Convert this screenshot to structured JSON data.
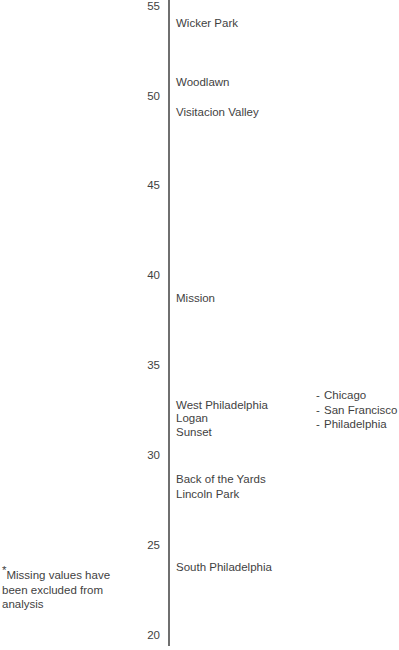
{
  "chart_data": {
    "type": "scatter",
    "orientation": "vertical-number-line",
    "title": "",
    "subtitle": "",
    "xlabel": "",
    "ylabel": "",
    "ylim": [
      20,
      55
    ],
    "y_ticks": [
      55,
      50,
      45,
      40,
      35,
      30,
      25,
      20
    ],
    "y_tick_labels": [
      "55",
      "50",
      "45",
      "40",
      "35",
      "30",
      "25",
      "20"
    ],
    "grid": false,
    "legend_position": "right",
    "series": [
      {
        "name": "Chicago",
        "points": [
          {
            "label": "Wicker Park",
            "value": 54.1
          },
          {
            "label": "Woodlawn",
            "value": 51.1
          },
          {
            "label": "Logan",
            "value": 32.2
          },
          {
            "label": "Back of the Yards",
            "value": 29.7
          },
          {
            "label": "Lincoln Park",
            "value": 28.9
          }
        ]
      },
      {
        "name": "San Francisco",
        "points": [
          {
            "label": "Visitacion Valley",
            "value": 49.4
          },
          {
            "label": "Mission",
            "value": 38.8
          },
          {
            "label": "Sunset",
            "value": 31.4
          }
        ]
      },
      {
        "name": "Philadelphia",
        "points": [
          {
            "label": "West Philadelphia",
            "value": 32.9
          },
          {
            "label": "South Philadelphia",
            "value": 24.8
          }
        ]
      }
    ],
    "point_labels": [
      {
        "label": "Wicker Park",
        "value": 54.1,
        "top": 17
      },
      {
        "label": "Woodlawn",
        "value": 51.1,
        "top": 76
      },
      {
        "label": "Visitacion Valley",
        "value": 49.4,
        "top": 106
      },
      {
        "label": "Mission",
        "value": 38.8,
        "top": 292
      },
      {
        "label": "West Philadelphia",
        "value": 32.9,
        "top": 399
      },
      {
        "label": "Logan",
        "value": 32.2,
        "top": 412
      },
      {
        "label": "Sunset",
        "value": 31.4,
        "top": 426
      },
      {
        "label": "Back of the Yards",
        "value": 29.7,
        "top": 473
      },
      {
        "label": "Lincoln Park",
        "value": 28.9,
        "top": 488
      },
      {
        "label": "South Philadelphia",
        "value": 24.8,
        "top": 561
      }
    ],
    "tick_positions": [
      {
        "label": "55",
        "top": 0
      },
      {
        "label": "50",
        "top": 90
      },
      {
        "label": "45",
        "top": 179
      },
      {
        "label": "40",
        "top": 269
      },
      {
        "label": "35",
        "top": 359
      },
      {
        "label": "30",
        "top": 449
      },
      {
        "label": "25",
        "top": 539
      },
      {
        "label": "20",
        "top": 629
      }
    ]
  },
  "legend": {
    "dash": "-",
    "items": [
      {
        "label": "Chicago"
      },
      {
        "label": "San Francisco"
      },
      {
        "label": "Philadelphia"
      }
    ]
  },
  "footnote": {
    "marker": "*",
    "text": "Missing values have been excluded from analysis"
  }
}
